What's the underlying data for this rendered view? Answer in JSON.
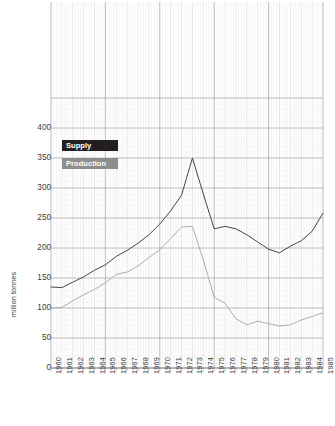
{
  "chart_data": {
    "type": "line",
    "title": "",
    "xlabel": "",
    "ylabel": "million tonnes",
    "ylim": [
      0,
      500
    ],
    "xlim": [
      1960,
      1985
    ],
    "yticks": [
      0,
      50,
      100,
      150,
      200,
      250,
      300,
      350,
      400
    ],
    "grid": true,
    "legend_position": "upper-left-inside",
    "x": [
      1960,
      1961,
      1962,
      1963,
      1964,
      1965,
      1966,
      1967,
      1968,
      1969,
      1970,
      1971,
      1972,
      1973,
      1974,
      1975,
      1976,
      1977,
      1978,
      1979,
      1980,
      1981,
      1982,
      1983,
      1984,
      1985
    ],
    "categories": [
      "1960",
      "1961",
      "1962",
      "1963",
      "1964",
      "1965",
      "1966",
      "1967",
      "1968",
      "1969",
      "1970",
      "1971",
      "1972",
      "1973",
      "1974",
      "1975",
      "1976",
      "1977",
      "1978",
      "1979",
      "1980",
      "1981",
      "1982",
      "1983",
      "1984",
      "1985"
    ],
    "series": [
      {
        "name": "Supply",
        "color": "#3c3c3c",
        "values": [
          135,
          134,
          143,
          152,
          163,
          172,
          186,
          196,
          208,
          222,
          240,
          262,
          288,
          350,
          290,
          232,
          236,
          232,
          222,
          210,
          198,
          192,
          203,
          212,
          228,
          258
        ]
      },
      {
        "name": "Production",
        "color": "#a9a9a9",
        "values": [
          100,
          101,
          112,
          122,
          131,
          142,
          156,
          160,
          170,
          184,
          197,
          216,
          235,
          236,
          180,
          118,
          108,
          82,
          72,
          78,
          74,
          70,
          72,
          80,
          86,
          92
        ]
      }
    ]
  },
  "legend": {
    "supply_label": "Supply",
    "production_label": "Production"
  },
  "axis": {
    "y_title": "million tonnes"
  }
}
